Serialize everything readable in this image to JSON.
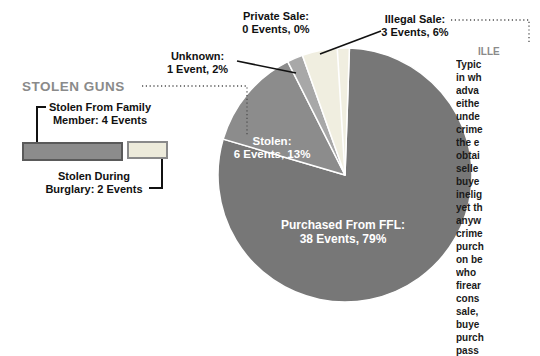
{
  "left_panel": {
    "heading": "STOLEN GUNS",
    "family_label": {
      "line1": "Stolen From Family",
      "line2": "Member: 4 Events"
    },
    "burglary_label": {
      "line1": "Stolen During",
      "line2": "Burglary: 2 Events"
    }
  },
  "callouts": {
    "private": {
      "line1": "Private Sale:",
      "line2": "0 Events, 0%"
    },
    "unknown": {
      "line1": "Unknown:",
      "line2": "1 Event, 2%"
    },
    "illegal": {
      "line1": "Illegal Sale:",
      "line2": "3 Events, 6%"
    }
  },
  "slice_labels": {
    "stolen": {
      "line1": "Stolen:",
      "line2": "6 Events, 13%"
    },
    "ffl": {
      "line1": "Purchased From FFL:",
      "line2": "38 Events, 79%"
    }
  },
  "chart_data": {
    "type": "pie",
    "total_events": 48,
    "start_angle_deg": 2,
    "direction": "clockwise",
    "slices": [
      {
        "label": "Purchased From FFL",
        "events": 38,
        "pct": 79,
        "color": "#777777"
      },
      {
        "label": "Stolen",
        "events": 6,
        "pct": 13,
        "color": "#8c8c8c"
      },
      {
        "label": "Unknown",
        "events": 1,
        "pct": 2,
        "color": "#a8a8a8"
      },
      {
        "label": "Illegal Sale",
        "events": 3,
        "pct": 6,
        "color": "#f0eee0"
      },
      {
        "label": "Private Sale",
        "events": 0,
        "pct": 0,
        "color": "#ffffff"
      }
    ],
    "stolen_breakdown_bars": [
      {
        "label": "Stolen From Family Member",
        "events": 4,
        "color": "#8c8c8c"
      },
      {
        "label": "Stolen During Burglary",
        "events": 2,
        "color": "#edebdb"
      }
    ],
    "slice_border_color": "#ffffff"
  },
  "sidebar_text": {
    "heading": "ILLE",
    "lines": [
      "Typic",
      "in wh",
      "adva",
      "eithe",
      "unde",
      "crime",
      "the e",
      "obtai",
      "selle",
      "buye",
      "inelig",
      "yet th",
      "anyw",
      "crime",
      "purch",
      "on be",
      "who",
      "firear",
      "cons",
      "sale,",
      "buye",
      "purch",
      "pass"
    ]
  },
  "colors": {
    "heading_gray": "#8a8a8a",
    "dotted_line": "#4f4f4f",
    "leader_line": "#111111",
    "bar_family_border": "#5a5a5a",
    "bar_burglary_border": "#8a8a8a"
  }
}
